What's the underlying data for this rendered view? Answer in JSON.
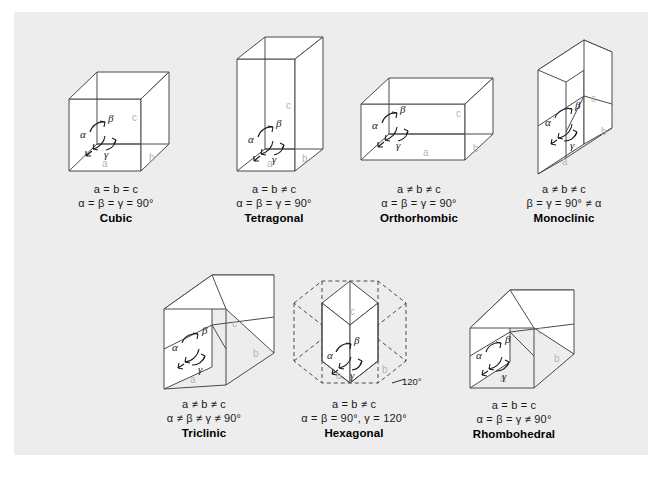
{
  "panel": {
    "background_color": "#ededed",
    "page_background_color": "#ffffff"
  },
  "colors": {
    "edge_stroke": "#4a4a4a",
    "face_fill": "#ffffff",
    "axis_label": "#b4b4b4",
    "greek_label": "#1a1a1a",
    "text": "#1a1a1a"
  },
  "axis_labels": {
    "a": "a",
    "b": "b",
    "c": "c"
  },
  "angle_labels": {
    "alpha": "α",
    "beta": "β",
    "gamma": "γ"
  },
  "systems": [
    {
      "id": "cubic",
      "name": "Cubic",
      "lengths": "a = b = c",
      "angles": "α = β = γ = 90°"
    },
    {
      "id": "tetragonal",
      "name": "Tetragonal",
      "lengths": "a = b ≠ c",
      "angles": "α = β = γ = 90°"
    },
    {
      "id": "orthorhombic",
      "name": "Orthorhombic",
      "lengths": "a ≠ b ≠ c",
      "angles": "α = β = γ = 90°"
    },
    {
      "id": "monoclinic",
      "name": "Monoclinic",
      "lengths": "a ≠ b ≠ c",
      "angles": "β = γ = 90° ≠ α"
    },
    {
      "id": "triclinic",
      "name": "Triclinic",
      "lengths": "a ≠ b ≠ c",
      "angles": "α ≠ β ≠ γ ≠ 90°"
    },
    {
      "id": "hexagonal",
      "name": "Hexagonal",
      "lengths": "a = b ≠ c",
      "angles": "α = β = 90°, γ = 120°",
      "annotation": "120°"
    },
    {
      "id": "rhombohedral",
      "name": "Rhombohedral",
      "lengths": "a = b = c",
      "angles": "α = β = γ ≠ 90°"
    }
  ]
}
